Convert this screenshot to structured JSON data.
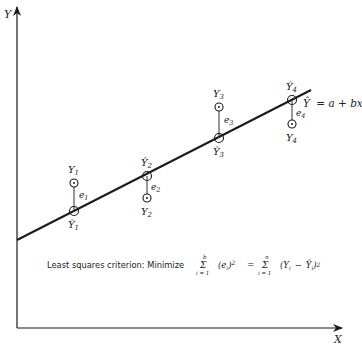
{
  "axes": {
    "y_label": "Y",
    "x_label": "X"
  },
  "regression_line": {
    "equation_hat": "Ŷ",
    "equation_rest": "= a + bx"
  },
  "points": [
    {
      "observed_label": "Y",
      "observed_sub": "1",
      "fitted_label": "Ŷ",
      "fitted_sub": "1",
      "error_label": "e",
      "error_sub": "1"
    },
    {
      "observed_label": "Y",
      "observed_sub": "2",
      "fitted_label": "Ŷ",
      "fitted_sub": "2",
      "error_label": "e",
      "error_sub": "2"
    },
    {
      "observed_label": "Y",
      "observed_sub": "3",
      "fitted_label": "Ŷ",
      "fitted_sub": "3",
      "error_label": "e",
      "error_sub": "3"
    },
    {
      "observed_label": "Y",
      "observed_sub": "4",
      "fitted_label": "Ŷ",
      "fitted_sub": "4",
      "error_label": "e",
      "error_sub": "4"
    }
  ],
  "criterion": {
    "prefix": "Least squares criterion: Minimize",
    "sum1_upper": "b",
    "sum1_lower": "i = 1",
    "sum1_term": "(e",
    "sum1_term_sub": "i",
    "sum1_term_close": ")",
    "sum1_power": "2",
    "equals": "=",
    "sum2_upper": "n",
    "sum2_lower": "i = 1",
    "sum2_term": "(Y",
    "sum2_term_sub": "i",
    "sum2_minus": "−",
    "sum2_hat": "Ŷ",
    "sum2_hat_sub": "i",
    "sum2_close": ")",
    "sum2_power": "2",
    "sigma": "Σ"
  },
  "colors": {
    "ink": "#1a1a1a",
    "background": "#ffffff"
  }
}
